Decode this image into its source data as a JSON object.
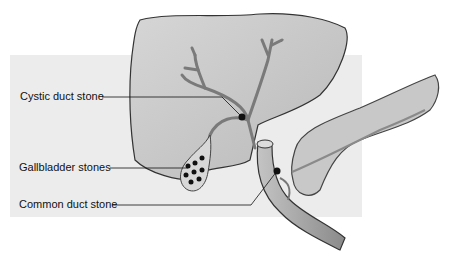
{
  "diagram": {
    "labels": [
      {
        "id": "cystic",
        "text": "Cystic duct stone"
      },
      {
        "id": "gallbladder",
        "text": "Gallbladder stones"
      },
      {
        "id": "common",
        "text": "Common duct stone"
      }
    ],
    "colors": {
      "background_panel": "#ececec",
      "organ_fill": "#c9c9c9",
      "organ_outline": "#333333",
      "stone": "#111111"
    }
  }
}
